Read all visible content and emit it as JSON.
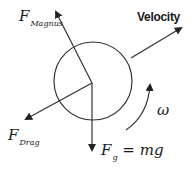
{
  "diagram": {
    "colors": {
      "stroke": "#333333",
      "text": "#1a1a1a",
      "background": "#ffffff"
    },
    "ball": {
      "cx": 93,
      "cy": 81,
      "r": 39
    },
    "origin": {
      "x": 92,
      "y": 83
    },
    "labels": {
      "magnus": {
        "main": "F",
        "sub": "Magnus"
      },
      "velocity": "Velocity",
      "drag": {
        "main": "F",
        "sub": "Drag"
      },
      "gravity": {
        "main": "F",
        "sub": "g",
        "rest": " = mg"
      },
      "omega": "ω"
    },
    "arrows": [
      {
        "name": "magnus-force",
        "from": [
          92,
          83
        ],
        "to": [
          55,
          10
        ]
      },
      {
        "name": "velocity",
        "from": [
          130,
          58
        ],
        "to": [
          183,
          27
        ]
      },
      {
        "name": "drag-force",
        "from": [
          92,
          83
        ],
        "to": [
          24,
          120
        ]
      },
      {
        "name": "gravity-force",
        "from": [
          92,
          83
        ],
        "to": [
          92,
          152
        ]
      }
    ],
    "rotation": {
      "label": "ω",
      "direction": "counter-clockwise"
    }
  }
}
